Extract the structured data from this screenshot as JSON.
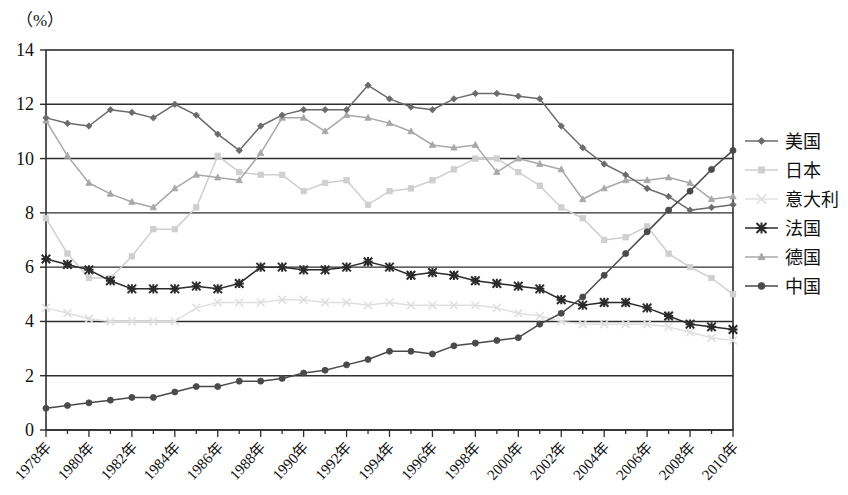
{
  "axis_unit_label": "（%）",
  "chart_data": {
    "type": "line",
    "title": "",
    "xlabel": "",
    "ylabel": "",
    "unit": "%",
    "grid": true,
    "legend_position": "right",
    "ylim": [
      0,
      14
    ],
    "yticks": [
      "0",
      "2",
      "4",
      "6",
      "8",
      "10",
      "12",
      "14"
    ],
    "ytick_values": [
      0,
      2,
      4,
      6,
      8,
      10,
      12,
      14
    ],
    "x": [
      1978,
      1979,
      1980,
      1981,
      1982,
      1983,
      1984,
      1985,
      1986,
      1987,
      1988,
      1989,
      1990,
      1991,
      1992,
      1993,
      1994,
      1995,
      1996,
      1997,
      1998,
      1999,
      2000,
      2001,
      2002,
      2003,
      2004,
      2005,
      2006,
      2007,
      2008,
      2009,
      2010
    ],
    "xtick_labels": [
      "1978年",
      "1980年",
      "1982年",
      "1984年",
      "1986年",
      "1988年",
      "1990年",
      "1992年",
      "1994年",
      "1996年",
      "1998年",
      "2000年",
      "2002年",
      "2004年",
      "2006年",
      "2008年",
      "2010年"
    ],
    "xtick_values": [
      1978,
      1980,
      1982,
      1984,
      1986,
      1988,
      1990,
      1992,
      1994,
      1996,
      1998,
      2000,
      2002,
      2004,
      2006,
      2008,
      2010
    ],
    "series": [
      {
        "name": "美国",
        "marker": "diamond",
        "color": "#6b6b6b",
        "values": [
          11.5,
          11.3,
          11.2,
          11.8,
          11.7,
          11.5,
          12.0,
          11.6,
          10.9,
          10.3,
          11.2,
          11.6,
          11.8,
          11.8,
          11.8,
          12.7,
          12.2,
          11.9,
          11.8,
          12.2,
          12.4,
          12.4,
          12.3,
          12.2,
          11.2,
          10.4,
          9.8,
          9.4,
          8.9,
          8.6,
          8.1,
          8.2,
          8.3
        ]
      },
      {
        "name": "日本",
        "marker": "square",
        "color": "#cfcfcf",
        "values": [
          7.8,
          6.5,
          5.6,
          5.6,
          6.4,
          7.4,
          7.4,
          8.2,
          10.1,
          9.5,
          9.4,
          9.4,
          8.8,
          9.1,
          9.2,
          8.3,
          8.8,
          8.9,
          9.2,
          9.6,
          10.0,
          10.0,
          9.5,
          9.0,
          8.2,
          7.8,
          7.0,
          7.1,
          7.5,
          6.5,
          6.0,
          5.6,
          5.0
        ]
      },
      {
        "name": "意大利",
        "marker": "x",
        "color": "#e0e0e0",
        "values": [
          4.5,
          4.3,
          4.1,
          4.0,
          4.0,
          4.0,
          4.0,
          4.5,
          4.7,
          4.7,
          4.7,
          4.8,
          4.8,
          4.7,
          4.7,
          4.6,
          4.7,
          4.6,
          4.6,
          4.6,
          4.6,
          4.5,
          4.3,
          4.2,
          4.0,
          3.9,
          3.9,
          3.9,
          3.9,
          3.8,
          3.6,
          3.4,
          3.3
        ]
      },
      {
        "name": "法国",
        "marker": "star",
        "color": "#2b2b2b",
        "values": [
          6.3,
          6.1,
          5.9,
          5.5,
          5.2,
          5.2,
          5.2,
          5.3,
          5.2,
          5.4,
          6.0,
          6.0,
          5.9,
          5.9,
          6.0,
          6.2,
          6.0,
          5.7,
          5.8,
          5.7,
          5.5,
          5.4,
          5.3,
          5.2,
          4.8,
          4.6,
          4.7,
          4.7,
          4.5,
          4.2,
          3.9,
          3.8,
          3.7
        ]
      },
      {
        "name": "德国",
        "marker": "triangle",
        "color": "#a8a8a8",
        "values": [
          11.4,
          10.1,
          9.1,
          8.7,
          8.4,
          8.2,
          8.9,
          9.4,
          9.3,
          9.2,
          10.2,
          11.5,
          11.5,
          11.0,
          11.6,
          11.5,
          11.3,
          11.0,
          10.5,
          10.4,
          10.5,
          9.5,
          10.0,
          9.8,
          9.6,
          8.5,
          8.9,
          9.2,
          9.2,
          9.3,
          9.1,
          8.5,
          8.6
        ]
      },
      {
        "name": "中国",
        "marker": "circle",
        "color": "#4a4a4a",
        "values": [
          0.8,
          0.9,
          1.0,
          1.1,
          1.2,
          1.2,
          1.4,
          1.6,
          1.6,
          1.8,
          1.8,
          1.9,
          2.1,
          2.2,
          2.4,
          2.6,
          2.9,
          2.9,
          2.8,
          3.1,
          3.2,
          3.3,
          3.4,
          3.9,
          4.3,
          4.9,
          5.7,
          6.5,
          7.3,
          8.1,
          8.8,
          9.6,
          10.3
        ]
      }
    ]
  },
  "legend": {
    "items": [
      {
        "label": "美国"
      },
      {
        "label": "日本"
      },
      {
        "label": "意大利"
      },
      {
        "label": "法国"
      },
      {
        "label": "德国"
      },
      {
        "label": "中国"
      }
    ]
  }
}
